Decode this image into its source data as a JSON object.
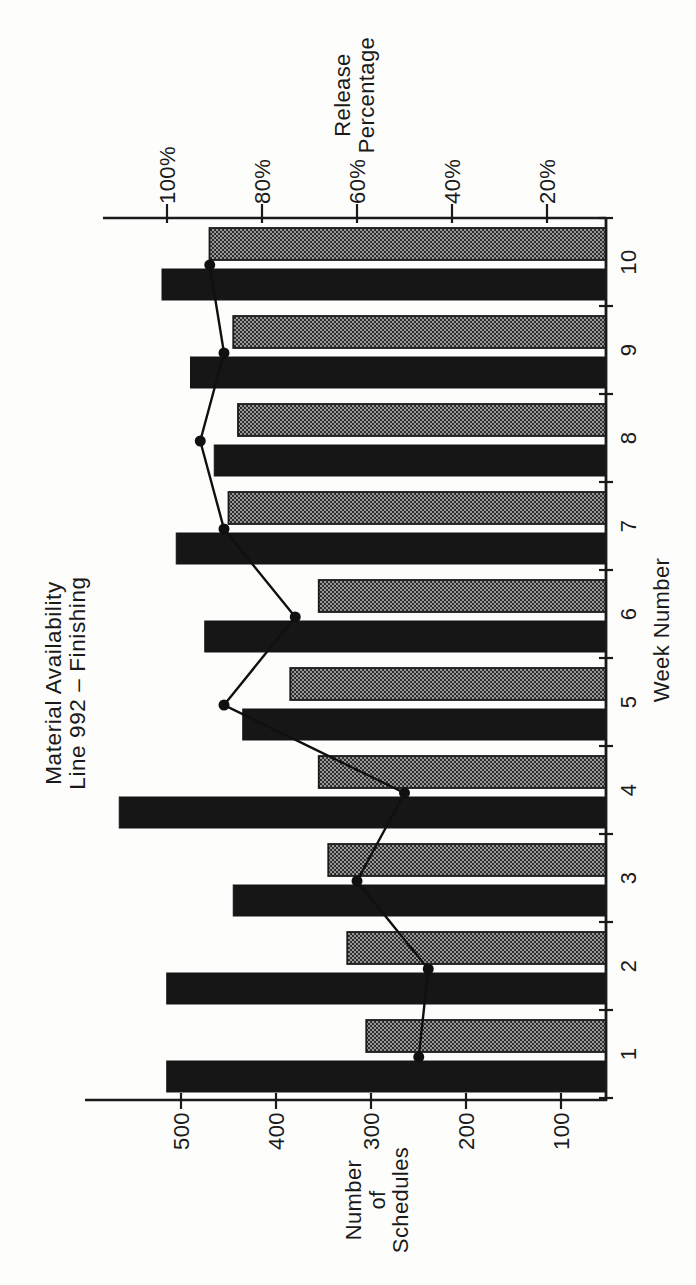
{
  "chart_data": {
    "type": "bar",
    "title": "Material Availability",
    "subtitle": "Line 992 – Finishing",
    "title_lines": [
      "Material Availability",
      "Line 992 – Finishing"
    ],
    "xlabel": "Week Number",
    "categories": [
      "1",
      "2",
      "3",
      "4",
      "5",
      "6",
      "7",
      "8",
      "9",
      "10"
    ],
    "left_axis": {
      "title_lines": [
        "Number",
        "of",
        "Schedules"
      ],
      "tick_values": [
        100,
        200,
        300,
        400,
        500
      ],
      "tick_labels": [
        "100",
        "200",
        "300",
        "400",
        "500"
      ]
    },
    "right_axis": {
      "title_lines": [
        "Release",
        "Percentage"
      ],
      "tick_values": [
        20,
        40,
        60,
        80,
        100
      ],
      "tick_labels": [
        "20%",
        "40%",
        "60%",
        "80%",
        "100%"
      ]
    },
    "series": [
      {
        "name": "schedules-dark-bars",
        "type": "bar",
        "axis": "left",
        "color": "#161616",
        "values": [
          515,
          515,
          445,
          565,
          435,
          475,
          505,
          465,
          490,
          520
        ]
      },
      {
        "name": "schedules-shaded-bars",
        "type": "bar",
        "axis": "left",
        "color": "#6f6f6f",
        "values": [
          305,
          325,
          345,
          355,
          385,
          355,
          450,
          440,
          445,
          470
        ]
      },
      {
        "name": "release-percentage-line",
        "type": "line",
        "axis": "right",
        "color": "#101010",
        "values": [
          47,
          45,
          60,
          50,
          88,
          73,
          88,
          93,
          88,
          91
        ]
      }
    ],
    "legend": null,
    "grid": false,
    "layout_hint": "landscape chart rotated 90deg CCW on portrait scanned page"
  },
  "colors": {
    "ink": "#1a1a1a",
    "dark_bar": "#161616",
    "shaded_bar_base": "#999999",
    "shaded_bar_dot": "#1f1f1f",
    "paper": "#fdfdfc"
  }
}
